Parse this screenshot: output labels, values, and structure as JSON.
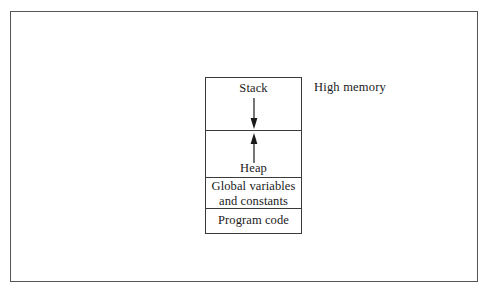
{
  "figure": {
    "background_color": "#ffffff",
    "frame_color": "#555555",
    "box_border_color": "#3a3a3a",
    "text_color": "#1a1a1a"
  },
  "memory_diagram": {
    "segments": [
      {
        "id": "stack",
        "label": "Stack"
      },
      {
        "id": "heap",
        "label": "Heap"
      },
      {
        "id": "globals",
        "label_line1": "Global variables",
        "label_line2": "and constants"
      },
      {
        "id": "code",
        "label": "Program code"
      }
    ],
    "arrows": [
      {
        "id": "stack-growth",
        "direction": "down",
        "from_segment": "stack",
        "meaning": "stack grows downward"
      },
      {
        "id": "heap-growth",
        "direction": "up",
        "from_segment": "heap",
        "meaning": "heap grows upward"
      }
    ]
  },
  "annotations": {
    "high_memory": "High memory"
  }
}
